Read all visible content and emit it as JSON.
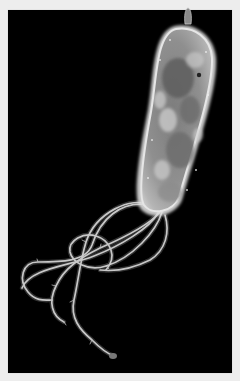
{
  "image": {
    "subject": "Electron micrograph of a rod-shaped bacterium with a tuft of looping flagella",
    "alt_text": "Grayscale micrograph of a bacterium on black background with flagella",
    "colors": {
      "frame": "#ededed",
      "background": "#000000",
      "cell_body_light": "#d8d8d8",
      "cell_body_mid": "#9a9a9a",
      "cell_body_dark": "#6a6a6a",
      "flagella": "#bdbdbd"
    }
  }
}
